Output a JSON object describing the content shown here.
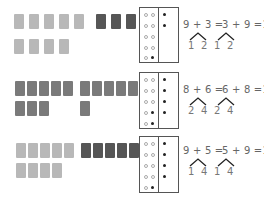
{
  "worksheet": {
    "rows": [
      {
        "left_group": {
          "count": 9,
          "shade": "light",
          "top": 5,
          "bottom": 4
        },
        "right_group": {
          "count": 3,
          "shade": "dark",
          "top": 3,
          "bottom": 0
        },
        "ten_frame": {
          "left_open": [
            1,
            1,
            1,
            1,
            1
          ],
          "left_filled_last": true,
          "right_filled": 2
        },
        "equation_left": "9 + 3 =",
        "equation_right": "3 + 9 =12",
        "split_left": [
          "1",
          "2"
        ],
        "split_right": [
          "1",
          "2"
        ]
      },
      {
        "left_group": {
          "count": 8,
          "shade": "mid",
          "top": 5,
          "bottom": 3
        },
        "right_group": {
          "count": 6,
          "shade": "mid",
          "top": 5,
          "bottom": 1
        },
        "ten_frame": {
          "left_filled_count": 2,
          "right_filled": 4
        },
        "equation_left": "8 + 6 =",
        "equation_right": "6 + 8 =14",
        "split_left": [
          "2",
          "4"
        ],
        "split_right": [
          "2",
          "4"
        ]
      },
      {
        "left_group": {
          "count": 9,
          "shade": "light",
          "top": 5,
          "bottom": 4
        },
        "right_group": {
          "count": 5,
          "shade": "dark",
          "top": 5,
          "bottom": 0
        },
        "ten_frame": {
          "left_filled_count": 1,
          "right_filled": 4
        },
        "equation_left": "9 + 5 =",
        "equation_right": "5 + 9 =14",
        "split_left": [
          "1",
          "4"
        ],
        "split_right": [
          "1",
          "4"
        ]
      }
    ]
  },
  "colors": {
    "light_block": "#b8b8b8",
    "mid_block": "#7a7a7a",
    "dark_block": "#565656",
    "frame_border": "#555555",
    "text": "#666666"
  }
}
